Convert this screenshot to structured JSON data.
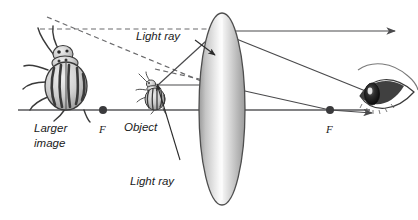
{
  "figure": {
    "background_color": "#ffffff",
    "width": 418,
    "height": 220
  },
  "labels": {
    "larger_image_line1": "Larger",
    "larger_image_line2": "image",
    "focal_left": "F",
    "focal_right": "F",
    "object": "Object",
    "light_ray_top": "Light ray",
    "light_ray_bottom": "Light ray"
  },
  "objects": {
    "large_beetle": {
      "name": "Colorado potato beetle (virtual enlarged image)",
      "body_fill": "#d8d8d8",
      "stripe_color": "#3a3a3a"
    },
    "small_beetle": {
      "name": "Colorado potato beetle (object)",
      "body_fill": "#d8d8d8",
      "stripe_color": "#3a3a3a"
    },
    "lens": {
      "name": "double convex converging lens",
      "fill_light": "#f2f2f2",
      "fill_mid": "#b9b9b9",
      "outline": "#4e4e4e"
    },
    "eye": {
      "name": "human eye viewing through lens",
      "iris_color": "#1a1a1a",
      "sclera_color": "#ffffff"
    }
  },
  "colors": {
    "axis": "#59595b",
    "ray_solid": "#4a4a4c",
    "ray_dashed": "#6a6a6c",
    "text": "#1a1a1a",
    "focal_point": "#3a3a3c"
  },
  "geometry": {
    "principal_axis_y": 110,
    "lens_center_x": 222,
    "focal_point_left_x": 103,
    "focal_point_right_x": 330,
    "object_x": 153,
    "image_x": 63
  }
}
